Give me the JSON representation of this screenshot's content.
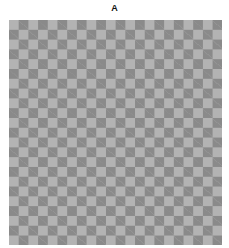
{
  "figure": {
    "title": "A",
    "pattern": "checkerboard",
    "columns": 22,
    "rows": 23,
    "colors": {
      "dark": "#8a8a8a",
      "light": "#b3b3b3"
    }
  }
}
